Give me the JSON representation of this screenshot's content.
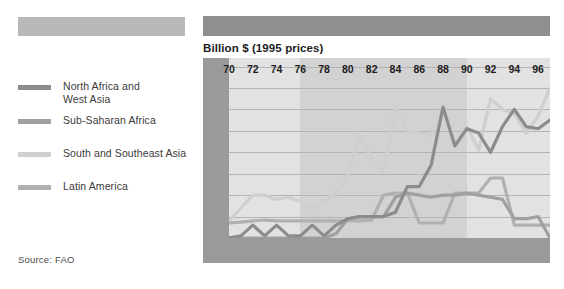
{
  "header": {
    "bar_left_color": "#b9b9b9",
    "bar_right_color": "#8f8f8f"
  },
  "legend": {
    "items": [
      {
        "label": "North Africa and\nWest Asia",
        "color": "#8c8c8c"
      },
      {
        "label": "Sub-Saharan Africa",
        "color": "#a0a0a0"
      },
      {
        "label": "South and Southeast Asia",
        "color": "#cfcfcf"
      },
      {
        "label": "Latin America",
        "color": "#b0b0b0"
      }
    ]
  },
  "source": {
    "text": "Source: FAO"
  },
  "chart_data": {
    "type": "line",
    "title": "Billion $ (1995 prices)",
    "xlabel": "",
    "ylabel": "Billion $ (1995 prices)",
    "ylim": [
      0,
      4.2
    ],
    "yticks": [
      "0",
      "0.5",
      "1",
      "1.5",
      "2",
      "2.5",
      "3",
      "3.5",
      "4"
    ],
    "ytick_values": [
      0,
      0.5,
      1,
      1.5,
      2,
      2.5,
      3,
      3.5,
      4
    ],
    "grid": true,
    "legend_position": "left-panel",
    "xlim": [
      1970,
      1997
    ],
    "xticks": [
      "70",
      "72",
      "74",
      "76",
      "78",
      "80",
      "82",
      "84",
      "86",
      "88",
      "90",
      "92",
      "94",
      "96"
    ],
    "xtick_values": [
      1970,
      1972,
      1974,
      1976,
      1978,
      1980,
      1982,
      1984,
      1986,
      1988,
      1990,
      1992,
      1994,
      1996
    ],
    "x": [
      1970,
      1971,
      1972,
      1973,
      1974,
      1975,
      1976,
      1977,
      1978,
      1979,
      1980,
      1981,
      1982,
      1983,
      1984,
      1985,
      1986,
      1987,
      1988,
      1989,
      1990,
      1991,
      1992,
      1993,
      1994,
      1995,
      1996,
      1997
    ],
    "shaded_band": {
      "from": 1976,
      "to": 1990,
      "color": "#d2d2d2"
    },
    "plot_background": "#e2e2e2",
    "series": [
      {
        "name": "North Africa and West Asia",
        "color": "#8c8c8c",
        "values": [
          0.0,
          0.05,
          0.3,
          0.05,
          0.3,
          0.05,
          0.05,
          0.3,
          0.05,
          0.3,
          0.45,
          0.5,
          0.5,
          0.5,
          0.6,
          1.2,
          1.2,
          1.7,
          3.05,
          2.15,
          2.55,
          2.45,
          2.0,
          2.6,
          3.0,
          2.6,
          2.55,
          2.75
        ]
      },
      {
        "name": "Sub-Saharan Africa",
        "color": "#a0a0a0",
        "values": [
          0.0,
          0.0,
          0.0,
          0.0,
          0.0,
          0.0,
          0.0,
          0.0,
          0.0,
          0.1,
          0.45,
          0.5,
          0.5,
          0.5,
          0.95,
          1.05,
          1.0,
          0.95,
          1.0,
          1.0,
          1.05,
          1.0,
          0.95,
          0.9,
          0.45,
          0.45,
          0.5,
          0.0
        ]
      },
      {
        "name": "South and Southeast Asia",
        "color": "#cfcfcf",
        "values": [
          0.4,
          0.7,
          1.0,
          1.0,
          0.9,
          0.95,
          0.85,
          0.7,
          0.85,
          1.05,
          1.45,
          2.4,
          1.85,
          1.55,
          3.05,
          2.5,
          2.45,
          2.4,
          3.05,
          2.2,
          2.6,
          2.05,
          3.25,
          3.0,
          2.9,
          2.45,
          2.85,
          3.5
        ]
      },
      {
        "name": "Latin America",
        "color": "#b0b0b0",
        "values": [
          0.35,
          0.37,
          0.4,
          0.42,
          0.4,
          0.4,
          0.4,
          0.4,
          0.4,
          0.4,
          0.4,
          0.4,
          0.42,
          1.0,
          1.05,
          1.05,
          0.35,
          0.35,
          0.35,
          1.05,
          1.05,
          1.05,
          1.4,
          1.4,
          0.3,
          0.3,
          0.3,
          0.3
        ]
      }
    ]
  }
}
